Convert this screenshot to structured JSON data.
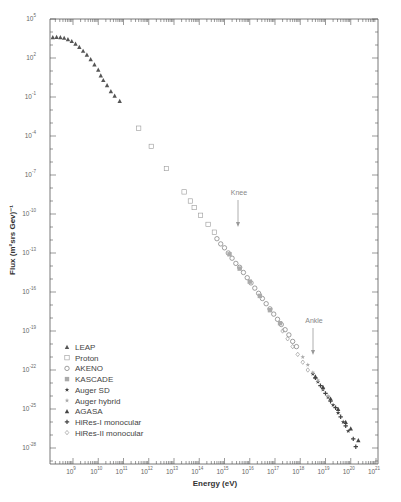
{
  "chart_data": {
    "type": "scatter",
    "title": "",
    "xlabel": "Energy (eV)",
    "ylabel": "Flux (m²srs Gev)⁻¹",
    "xscale": "log",
    "yscale": "log",
    "xlim": [
      130000000.0,
      1e+21
    ],
    "ylim": [
      6e-30,
      100000.0
    ],
    "grid": false,
    "legend_position": "lower left",
    "x_ticks": [
      {
        "exp": 9,
        "label": "10"
      },
      {
        "exp": 10,
        "label": "10"
      },
      {
        "exp": 11,
        "label": "10"
      },
      {
        "exp": 12,
        "label": "10"
      },
      {
        "exp": 13,
        "label": "10"
      },
      {
        "exp": 14,
        "label": "10"
      },
      {
        "exp": 15,
        "label": "10"
      },
      {
        "exp": 16,
        "label": "10"
      },
      {
        "exp": 17,
        "label": "10"
      },
      {
        "exp": 18,
        "label": "10"
      },
      {
        "exp": 19,
        "label": "10"
      },
      {
        "exp": 20,
        "label": "10"
      },
      {
        "exp": 21,
        "label": "10"
      }
    ],
    "y_ticks": [
      {
        "exp": 5,
        "label": "10"
      },
      {
        "exp": 2,
        "label": "10"
      },
      {
        "exp": -1,
        "label": "10"
      },
      {
        "exp": -4,
        "label": "10"
      },
      {
        "exp": -7,
        "label": "10"
      },
      {
        "exp": -10,
        "label": "10"
      },
      {
        "exp": -13,
        "label": "10"
      },
      {
        "exp": -16,
        "label": "10"
      },
      {
        "exp": -19,
        "label": "10"
      },
      {
        "exp": -22,
        "label": "10"
      },
      {
        "exp": -25,
        "label": "10"
      },
      {
        "exp": -28,
        "label": "10"
      }
    ],
    "annotations": [
      {
        "text": "Knee",
        "log_energy": 15.65,
        "log_flux": -8.6
      },
      {
        "text": "Ankle",
        "log_energy": 18.6,
        "log_flux": -18.5
      }
    ],
    "series": [
      {
        "name": "LEAP",
        "marker": "triangle",
        "color": "#555555",
        "points_log": [
          [
            8.2,
            3.6
          ],
          [
            8.35,
            3.62
          ],
          [
            8.5,
            3.6
          ],
          [
            8.65,
            3.55
          ],
          [
            8.8,
            3.45
          ],
          [
            8.95,
            3.3
          ],
          [
            9.1,
            3.1
          ],
          [
            9.25,
            2.85
          ],
          [
            9.4,
            2.55
          ],
          [
            9.55,
            2.25
          ],
          [
            9.7,
            1.9
          ],
          [
            9.85,
            1.5
          ],
          [
            10.0,
            1.1
          ],
          [
            10.1,
            0.65
          ],
          [
            10.2,
            0.3
          ],
          [
            10.35,
            -0.1
          ],
          [
            10.5,
            -0.55
          ],
          [
            10.65,
            -0.9
          ],
          [
            10.85,
            -1.3
          ]
        ]
      },
      {
        "name": "Proton",
        "marker": "square",
        "color": "#999999",
        "points_log": [
          [
            11.6,
            -3.4
          ],
          [
            12.1,
            -4.8
          ],
          [
            12.7,
            -6.5
          ],
          [
            13.4,
            -8.3
          ],
          [
            13.65,
            -9.0
          ],
          [
            13.8,
            -9.5
          ],
          [
            14.05,
            -10.1
          ],
          [
            14.35,
            -10.8
          ],
          [
            14.6,
            -11.4
          ]
        ]
      },
      {
        "name": "AKENO",
        "marker": "circle",
        "color": "#777777",
        "points_log": [
          [
            14.7,
            -11.9
          ],
          [
            14.85,
            -12.3
          ],
          [
            15.0,
            -12.6
          ],
          [
            15.15,
            -13.0
          ],
          [
            15.3,
            -13.4
          ],
          [
            15.45,
            -13.8
          ],
          [
            15.6,
            -14.1
          ],
          [
            15.75,
            -14.5
          ],
          [
            15.9,
            -14.9
          ],
          [
            16.05,
            -15.3
          ],
          [
            16.2,
            -15.7
          ],
          [
            16.35,
            -16.1
          ],
          [
            16.5,
            -16.5
          ],
          [
            16.65,
            -16.9
          ],
          [
            16.8,
            -17.3
          ],
          [
            16.95,
            -17.7
          ],
          [
            17.1,
            -18.1
          ],
          [
            17.25,
            -18.5
          ],
          [
            17.4,
            -18.9
          ],
          [
            17.55,
            -19.3
          ],
          [
            17.7,
            -19.8
          ],
          [
            17.85,
            -20.2
          ]
        ]
      },
      {
        "name": "KASCADE",
        "marker": "square-filled",
        "color": "#aaaaaa",
        "points_log": [
          [
            15.2,
            -13.1
          ],
          [
            15.6,
            -14.2
          ],
          [
            16.0,
            -15.2
          ],
          [
            16.4,
            -16.3
          ],
          [
            16.8,
            -17.4
          ],
          [
            17.2,
            -18.4
          ]
        ]
      },
      {
        "name": "Auger SD",
        "marker": "star",
        "color": "#444444",
        "points_log": [
          [
            18.5,
            -22.3
          ],
          [
            18.7,
            -22.9
          ],
          [
            18.9,
            -23.5
          ],
          [
            19.1,
            -24.1
          ],
          [
            19.3,
            -24.7
          ],
          [
            19.5,
            -25.3
          ],
          [
            19.7,
            -26.0
          ],
          [
            19.9,
            -26.7
          ]
        ]
      },
      {
        "name": "Auger hybrid",
        "marker": "star",
        "color": "#aaaaaa",
        "points_log": [
          [
            18.1,
            -21.0
          ],
          [
            18.3,
            -21.6
          ],
          [
            18.5,
            -22.2
          ],
          [
            18.7,
            -22.8
          ],
          [
            18.9,
            -23.4
          ],
          [
            19.1,
            -24.0
          ]
        ]
      },
      {
        "name": "AGASA",
        "marker": "triangle",
        "color": "#444444",
        "points_log": [
          [
            18.6,
            -22.5
          ],
          [
            18.9,
            -23.3
          ],
          [
            19.2,
            -24.2
          ],
          [
            19.5,
            -25.0
          ],
          [
            19.8,
            -26.0
          ],
          [
            20.0,
            -26.5
          ],
          [
            20.3,
            -27.4
          ]
        ]
      },
      {
        "name": "HiRes-I monocular",
        "marker": "plus",
        "color": "#444444",
        "points_log": [
          [
            18.6,
            -22.6
          ],
          [
            18.8,
            -23.2
          ],
          [
            19.0,
            -23.8
          ],
          [
            19.2,
            -24.4
          ],
          [
            19.4,
            -24.9
          ],
          [
            19.6,
            -25.6
          ],
          [
            19.8,
            -26.3
          ],
          [
            20.1,
            -27.3
          ],
          [
            20.2,
            -27.9
          ]
        ]
      },
      {
        "name": "HiRes-II monocular",
        "marker": "diamond",
        "color": "#888888",
        "points_log": [
          [
            17.3,
            -19.0
          ],
          [
            17.5,
            -19.6
          ],
          [
            17.7,
            -20.2
          ],
          [
            17.9,
            -20.8
          ],
          [
            18.1,
            -21.4
          ],
          [
            18.3,
            -22.0
          ]
        ]
      }
    ]
  },
  "legend": {
    "items": [
      {
        "label": "LEAP",
        "marker": "triangle",
        "color": "#555555"
      },
      {
        "label": "Proton",
        "marker": "square",
        "color": "#999999"
      },
      {
        "label": "AKENO",
        "marker": "circle",
        "color": "#777777"
      },
      {
        "label": "KASCADE",
        "marker": "square-filled",
        "color": "#aaaaaa"
      },
      {
        "label": "Auger SD",
        "marker": "star",
        "color": "#444444"
      },
      {
        "label": "Auger hybrid",
        "marker": "star",
        "color": "#aaaaaa"
      },
      {
        "label": "AGASA",
        "marker": "triangle",
        "color": "#444444"
      },
      {
        "label": "HiRes-I monocular",
        "marker": "plus",
        "color": "#444444"
      },
      {
        "label": "HiRes-II monocular",
        "marker": "diamond",
        "color": "#888888"
      }
    ]
  },
  "axes": {
    "x_title": "Energy (eV)",
    "y_title": "Flux (m²srs Gev)⁻¹"
  },
  "annotations": {
    "knee": "Knee",
    "ankle": "Ankle"
  }
}
